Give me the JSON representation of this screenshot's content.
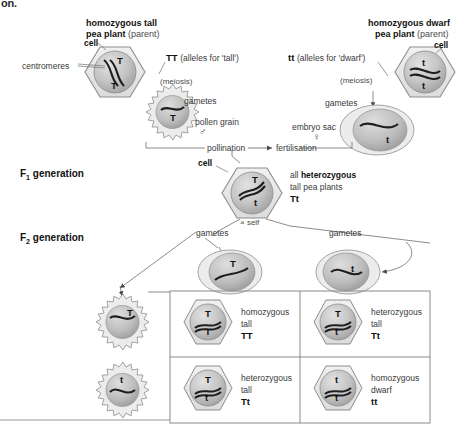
{
  "figure": {
    "clipped_caption": "on.",
    "type": "genetics-inheritance-diagram"
  },
  "colors": {
    "cell_fill": "#e8e8e8",
    "cell_stroke": "#8d8d8d",
    "nucleus_light": "#d9d9d9",
    "nucleus_dark": "#9a9a9a",
    "chromosome": "#1e1e1e",
    "line": "#6f6f6f",
    "box_border": "#8a8a8a",
    "text": "#2a2a2a"
  },
  "parents": {
    "left": {
      "title_bold": "homozygous tall",
      "title_line2_bold": "pea plant",
      "title_line2_thin": "(parent)",
      "cell_label": "cell",
      "centromeres_label": "centromeres",
      "genotype": "TT",
      "genotype_note": "(alleles for 'tall')",
      "meiosis_label": "(meiosis)",
      "gametes_label": "gametes",
      "chromosome_alleles": [
        "T",
        "T"
      ],
      "gamete_allele": "T",
      "gamete_name": "pollen grain",
      "gamete_sex_symbol": "♂"
    },
    "right": {
      "title_bold": "homozygous dwarf",
      "title_line2_bold": "pea plant",
      "title_line2_thin": "(parent)",
      "cell_label": "cell",
      "genotype": "tt",
      "genotype_note": "(alleles for 'dwarf')",
      "meiosis_label": "(meiosis)",
      "gametes_label": "gametes",
      "chromosome_alleles": [
        "t",
        "t"
      ],
      "gamete_allele": "t",
      "gamete_name": "embryo sac",
      "gamete_sex_symbol": "♀"
    }
  },
  "crossing": {
    "pollination_label": "pollination",
    "fertilisation_label": "fertilisation"
  },
  "f1": {
    "generation_label": "F",
    "generation_sub": "1",
    "generation_word": "generation",
    "cell_label": "cell",
    "description_thin": "all ",
    "description_bold": "heterozygous",
    "description_line2": "tall pea plants",
    "genotype": "Tt",
    "chromosome_alleles": [
      "T",
      "t"
    ],
    "self_label": "× self"
  },
  "f2": {
    "generation_label": "F",
    "generation_sub": "2",
    "generation_word": "generation",
    "gametes_label_left": "gametes",
    "gametes_label_right": "gametes",
    "top_gametes": [
      "T",
      "t"
    ],
    "side_gametes": [
      "T",
      "t"
    ],
    "offspring": [
      {
        "alleles": [
          "T",
          "T"
        ],
        "desc_line1": "homozygous",
        "desc_line2": "tall",
        "genotype": "TT"
      },
      {
        "alleles": [
          "T",
          "t"
        ],
        "desc_line1": "heterozygous",
        "desc_line2": "tall",
        "genotype": "Tt"
      },
      {
        "alleles": [
          "T",
          "t"
        ],
        "desc_line1": "heterozygous",
        "desc_line2": "tall",
        "genotype": "Tt"
      },
      {
        "alleles": [
          "t",
          "t"
        ],
        "desc_line1": "homozygous",
        "desc_line2": "dwarf",
        "genotype": "tt"
      }
    ]
  }
}
